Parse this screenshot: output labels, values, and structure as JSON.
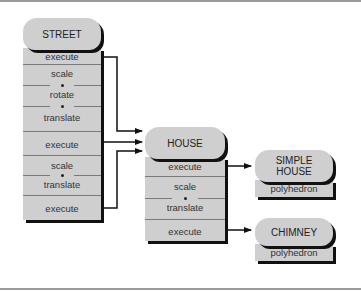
{
  "diagram": {
    "nodes": {
      "street": {
        "title": "STREET",
        "rows": [
          {
            "type": "single",
            "label": "execute"
          },
          {
            "type": "group",
            "labels": [
              "scale",
              "rotate",
              "translate"
            ]
          },
          {
            "type": "single",
            "label": "execute"
          },
          {
            "type": "group",
            "labels": [
              "scale",
              "translate"
            ]
          },
          {
            "type": "single",
            "label": "execute"
          }
        ]
      },
      "house": {
        "title": "HOUSE",
        "rows": [
          {
            "type": "single",
            "label": "execute"
          },
          {
            "type": "group",
            "labels": [
              "scale",
              "translate"
            ]
          },
          {
            "type": "single",
            "label": "execute"
          }
        ]
      },
      "simple_house": {
        "title": "SIMPLE HOUSE",
        "title_lines": [
          "SIMPLE",
          "HOUSE"
        ],
        "rows": [
          {
            "type": "single",
            "label": "polyhedron"
          }
        ]
      },
      "chimney": {
        "title": "CHIMNEY",
        "rows": [
          {
            "type": "single",
            "label": "polyhedron"
          }
        ]
      }
    },
    "edges": [
      {
        "from": "STREET.execute[0]",
        "to": "HOUSE"
      },
      {
        "from": "STREET.execute[1]",
        "to": "HOUSE"
      },
      {
        "from": "STREET.execute[2]",
        "to": "HOUSE"
      },
      {
        "from": "HOUSE.execute[0]",
        "to": "SIMPLE HOUSE"
      },
      {
        "from": "HOUSE.execute[1]",
        "to": "CHIMNEY"
      }
    ],
    "colors": {
      "box_fill": "#cfcfcf",
      "shadow": "#111111",
      "divider": "#7a7a7a",
      "rule": "#9a9a9a"
    }
  }
}
